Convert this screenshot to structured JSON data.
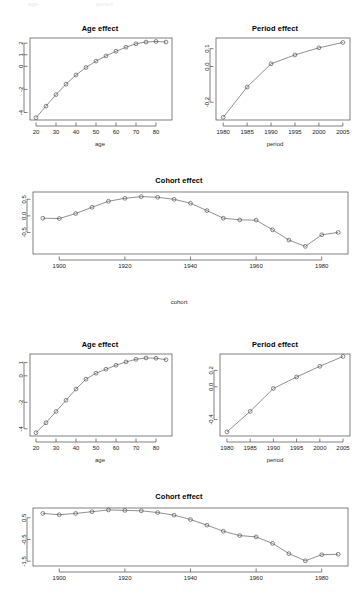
{
  "figure": {
    "ghost_top_left": "age",
    "ghost_top_right": "period"
  },
  "panels": {
    "age1": {
      "title": "Age effect",
      "xlabel": "age"
    },
    "period1": {
      "title": "Period effect",
      "xlabel": "period"
    },
    "cohort1": {
      "title": "Cohort effect",
      "xlabel": "cohort"
    },
    "age2": {
      "title": "Age effect",
      "xlabel": "age"
    },
    "period2": {
      "title": "Period effect",
      "xlabel": "period"
    },
    "cohort2": {
      "title": "Cohort effect",
      "xlabel": "cohort"
    }
  },
  "chart_data": [
    {
      "id": "age1",
      "type": "line",
      "title": "Age effect",
      "xlabel": "age",
      "ylabel": "",
      "grid": false,
      "legend": null,
      "marker": "open-circle",
      "xlim": [
        17,
        88
      ],
      "ylim": [
        -4.65,
        2.45
      ],
      "xticks": [
        20,
        30,
        40,
        50,
        60,
        70,
        80
      ],
      "xticklabels": [
        "20",
        "30",
        "40",
        "50",
        "60",
        "70",
        "80"
      ],
      "yticks": [
        2,
        1,
        0,
        -2,
        -4
      ],
      "yticklabels": [
        "2",
        "1",
        "0",
        "-2",
        "-4"
      ],
      "x": [
        20,
        25,
        30,
        35,
        40,
        45,
        50,
        55,
        60,
        65,
        70,
        75,
        80,
        85
      ],
      "values": [
        -4.45,
        -3.45,
        -2.45,
        -1.55,
        -0.75,
        -0.1,
        0.45,
        0.9,
        1.3,
        1.65,
        1.95,
        2.1,
        2.15,
        2.1
      ]
    },
    {
      "id": "period1",
      "type": "line",
      "title": "Period effect",
      "xlabel": "period",
      "ylabel": "",
      "grid": false,
      "legend": null,
      "marker": "open-circle",
      "xlim": [
        1978.5,
        2006.5
      ],
      "ylim": [
        -0.3,
        0.16
      ],
      "xticks": [
        1980,
        1985,
        1990,
        1995,
        2000,
        2005
      ],
      "xticklabels": [
        "1980",
        "1985",
        "1990",
        "1995",
        "2000",
        "2005"
      ],
      "yticks": [
        0.1,
        0.0,
        -0.2
      ],
      "yticklabels": [
        "0.1",
        "0.0",
        "-0.2"
      ],
      "x": [
        1980,
        1985,
        1990,
        1995,
        2000,
        2005
      ],
      "values": [
        -0.285,
        -0.115,
        0.015,
        0.065,
        0.105,
        0.135
      ]
    },
    {
      "id": "cohort1",
      "type": "line",
      "title": "Cohort effect",
      "xlabel": "cohort",
      "ylabel": "",
      "grid": false,
      "legend": null,
      "marker": "open-circle",
      "xlim": [
        1892,
        1988
      ],
      "ylim": [
        -1.15,
        0.72
      ],
      "xticks": [
        1900,
        1920,
        1940,
        1960,
        1980
      ],
      "xticklabels": [
        "1900",
        "1920",
        "1940",
        "1960",
        "1980"
      ],
      "yticks": [
        0.5,
        0.0,
        -0.5
      ],
      "yticklabels": [
        "0.5",
        "0.0",
        "-0.5"
      ],
      "x": [
        1895,
        1900,
        1905,
        1910,
        1915,
        1920,
        1925,
        1930,
        1935,
        1940,
        1945,
        1950,
        1955,
        1960,
        1965,
        1970,
        1975,
        1980,
        1985
      ],
      "values": [
        -0.07,
        -0.08,
        0.07,
        0.26,
        0.44,
        0.53,
        0.58,
        0.56,
        0.5,
        0.38,
        0.16,
        -0.07,
        -0.12,
        -0.13,
        -0.42,
        -0.73,
        -0.92,
        -0.57,
        -0.5
      ]
    },
    {
      "id": "age2",
      "type": "line",
      "title": "Age effect",
      "xlabel": "age",
      "ylabel": "",
      "grid": false,
      "legend": null,
      "marker": "open-circle",
      "xlim": [
        17,
        88
      ],
      "ylim": [
        -4.55,
        1.65
      ],
      "xticks": [
        20,
        30,
        40,
        50,
        60,
        70,
        80
      ],
      "xticklabels": [
        "20",
        "30",
        "40",
        "50",
        "60",
        "70",
        "80"
      ],
      "yticks": [
        1,
        0,
        -2,
        -4
      ],
      "yticklabels": [
        "1",
        "0",
        "-2",
        "-4"
      ],
      "x": [
        20,
        25,
        30,
        35,
        40,
        45,
        50,
        55,
        60,
        65,
        70,
        75,
        80,
        85
      ],
      "values": [
        -4.3,
        -3.55,
        -2.7,
        -1.85,
        -1.0,
        -0.25,
        0.2,
        0.5,
        0.8,
        1.05,
        1.25,
        1.35,
        1.33,
        1.22
      ]
    },
    {
      "id": "period2",
      "type": "line",
      "title": "Period effect",
      "xlabel": "period",
      "ylabel": "",
      "grid": false,
      "legend": null,
      "marker": "open-circle",
      "xlim": [
        1978.5,
        2006.5
      ],
      "ylim": [
        -0.6,
        0.4
      ],
      "xticks": [
        1980,
        1985,
        1990,
        1995,
        2000,
        2005
      ],
      "xticklabels": [
        "1980",
        "1985",
        "1990",
        "1995",
        "2000",
        "2005"
      ],
      "yticks": [
        0.2,
        0.0,
        -0.4
      ],
      "yticklabels": [
        "0.2",
        "0.0",
        "-0.4"
      ],
      "x": [
        1980,
        1985,
        1990,
        1995,
        2000,
        2005
      ],
      "values": [
        -0.55,
        -0.3,
        -0.02,
        0.12,
        0.25,
        0.37
      ]
    },
    {
      "id": "cohort2",
      "type": "line",
      "title": "Cohort effect",
      "xlabel": "cohort",
      "ylabel": "",
      "grid": false,
      "legend": null,
      "marker": "open-circle",
      "xlim": [
        1892,
        1988
      ],
      "ylim": [
        -1.72,
        0.95
      ],
      "xticks": [
        1900,
        1920,
        1940,
        1960,
        1980
      ],
      "xticklabels": [
        "1900",
        "1920",
        "1940",
        "1960",
        "1980"
      ],
      "yticks": [
        0.5,
        -0.5,
        -1.5
      ],
      "yticklabels": [
        "0.5",
        "-0.5",
        "-1.5"
      ],
      "x": [
        1895,
        1900,
        1905,
        1910,
        1915,
        1920,
        1925,
        1930,
        1935,
        1940,
        1945,
        1950,
        1955,
        1960,
        1965,
        1970,
        1975,
        1980,
        1985
      ],
      "values": [
        0.7,
        0.64,
        0.7,
        0.78,
        0.86,
        0.84,
        0.82,
        0.74,
        0.62,
        0.42,
        0.16,
        -0.12,
        -0.32,
        -0.38,
        -0.68,
        -1.15,
        -1.48,
        -1.2,
        -1.18
      ]
    }
  ]
}
